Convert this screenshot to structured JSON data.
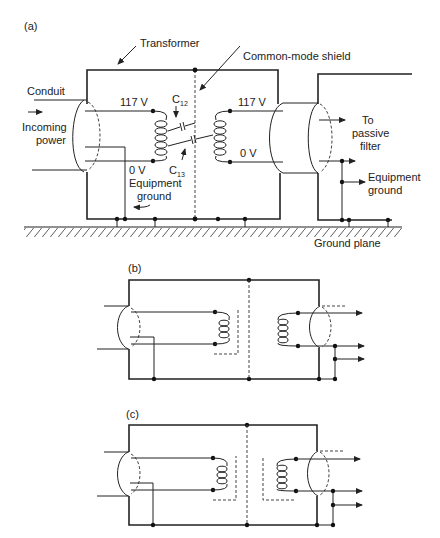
{
  "figure": {
    "panels": [
      {
        "id": "a",
        "label": "(a)",
        "annotations": {
          "transformer": "Transformer",
          "shield": "Common-mode shield",
          "conduit": "Conduit",
          "incoming_1": "Incoming",
          "incoming_2": "power",
          "v_in_hi": "117 V",
          "v_in_lo": "0 V",
          "v_out_hi": "117 V",
          "v_out_lo": "0 V",
          "c12": "C",
          "c12_sub": "12",
          "c13": "C",
          "c13_sub": "13",
          "equip_ground_1": "Equipment",
          "equip_ground_2": "ground",
          "to_1": "To",
          "to_2": "passive",
          "to_3": "filter",
          "equip_ground_out_1": "Equipment",
          "equip_ground_out_2": "ground",
          "ground_plane": "Ground plane"
        }
      },
      {
        "id": "b",
        "label": "(b)"
      },
      {
        "id": "c",
        "label": "(c)"
      }
    ]
  }
}
